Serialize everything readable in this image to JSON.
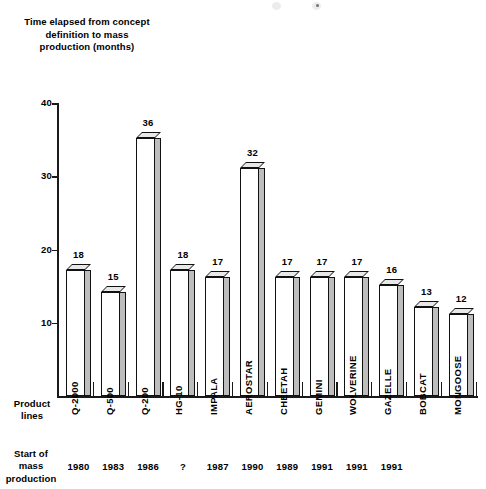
{
  "axis_caption": "Time elapsed from concept definition to mass production (months)",
  "row_labels": {
    "product_lines": "Product lines",
    "start_of_mass_production": "Start of mass production"
  },
  "chart_data": {
    "type": "bar",
    "title": "Time elapsed from concept definition to mass production (months)",
    "xlabel": "Product lines",
    "ylabel": "Time elapsed from concept definition to mass production (months)",
    "ylim": [
      0,
      40
    ],
    "yticks": [
      10,
      20,
      30,
      40
    ],
    "ytick_labels": [
      "10",
      "20",
      "30",
      "40"
    ],
    "grid": false,
    "legend": false,
    "categories": [
      "Q-2000",
      "Q-500",
      "Q-200",
      "HG-10",
      "IMPALA",
      "AEROSTAR",
      "CHEETAH",
      "GEMINI",
      "WOLVERINE",
      "GAZELLE",
      "BOBCAT",
      "MONGOOSE"
    ],
    "values": [
      18,
      15,
      36,
      18,
      17,
      32,
      17,
      17,
      17,
      16,
      13,
      12
    ],
    "value_labels": [
      "18",
      "15",
      "36",
      "18",
      "17",
      "32",
      "17",
      "17",
      "17",
      "16",
      "13",
      "12"
    ],
    "secondary_axis": {
      "label": "Start of mass production",
      "values": [
        "1980",
        "1983",
        "1986",
        "?",
        "1987",
        "1990",
        "1989",
        "1991",
        "1991",
        "1991",
        "",
        ""
      ]
    }
  }
}
